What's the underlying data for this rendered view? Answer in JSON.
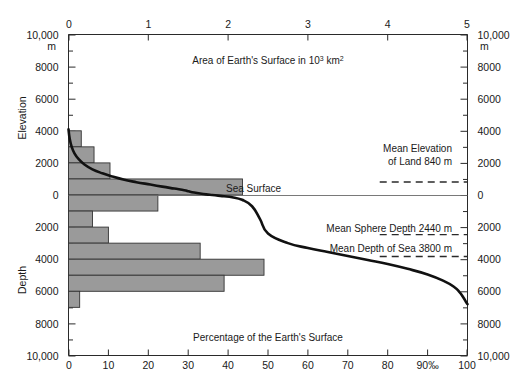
{
  "figure": {
    "top_caption": "Area of Earth's Surface in 10",
    "top_caption_sup": "3",
    "top_caption_tail": " km",
    "top_caption_sup2": "2",
    "bottom_caption": "Percentage of the Earth's Surface",
    "sea_surface_label": "Sea Surface",
    "left_axis_title_upper": "Elevation",
    "left_axis_title_lower": "Depth",
    "top_unit_left": "m",
    "top_unit_right": "m"
  },
  "annotations": [
    {
      "id": "mean-elevation-land",
      "line1": "Mean Elevation",
      "line2": "of Land 840 m",
      "value_m": 840
    },
    {
      "id": "mean-sphere-depth",
      "line1": "Mean Sphere Depth 2440 m",
      "line2": "",
      "value_m": -2440
    },
    {
      "id": "mean-depth-sea",
      "line1": "Mean Depth of Sea 3800 m",
      "line2": "",
      "value_m": -3800
    }
  ],
  "axes": {
    "left_ticks": [
      "10,000",
      "8000",
      "6000",
      "4000",
      "2000",
      "0",
      "2000",
      "4000",
      "6000",
      "8000",
      "10,000"
    ],
    "right_ticks": [
      "10,000",
      "8000",
      "6000",
      "4000",
      "2000",
      "0",
      "2000",
      "4000",
      "6000",
      "8000",
      "10,000"
    ],
    "top_ticks": [
      "0",
      "1",
      "2",
      "3",
      "4",
      "5"
    ],
    "bottom_ticks": [
      "0",
      "10",
      "20",
      "30",
      "40",
      "50",
      "60",
      "70",
      "80",
      "90%",
      "100"
    ],
    "bottom_permille_mark": "90‰",
    "y_range_m": [
      10000,
      -10000
    ],
    "top_x_range": [
      0,
      5
    ],
    "bottom_x_range": [
      0,
      100
    ]
  },
  "chart_data": {
    "type": "area",
    "xlabel": "Percentage of the Earth's Surface",
    "ylabel": "Elevation / Depth (m)",
    "xlim": [
      0,
      100
    ],
    "ylim": [
      -10000,
      10000
    ],
    "grid": false,
    "legend": "none",
    "series": [
      {
        "name": "Hypsographic curve",
        "type": "line",
        "color": "#111111",
        "x": [
          0.0,
          0.3,
          0.8,
          1.5,
          2.5,
          4.0,
          6.0,
          8.5,
          11.0,
          14.0,
          17.0,
          20.5,
          23.5,
          26.5,
          29.0,
          29.8,
          30.5,
          31.5,
          33.0,
          34.5,
          36.0,
          37.5,
          39.0,
          41.0,
          43.5,
          46.0,
          48.0,
          50.0,
          55.0,
          60.0,
          65.0,
          70.0,
          75.0,
          80.0,
          85.0,
          90.0,
          94.0,
          96.5,
          98.0,
          99.0,
          99.6,
          100.0
        ],
        "y": [
          4100,
          3500,
          3000,
          2600,
          2250,
          1900,
          1600,
          1350,
          1150,
          950,
          800,
          650,
          520,
          400,
          300,
          250,
          200,
          150,
          90,
          40,
          0,
          -40,
          -80,
          -140,
          -300,
          -700,
          -1500,
          -2400,
          -3000,
          -3300,
          -3550,
          -3800,
          -4050,
          -4300,
          -4600,
          -4950,
          -5350,
          -5700,
          -6050,
          -6400,
          -6650,
          -6800
        ]
      },
      {
        "name": "Area-frequency histogram (bars)",
        "type": "bar",
        "orientation": "horizontal",
        "color": "#9a9a9a",
        "edge_color": "#333333",
        "note": "Bar length read on top axis: Area of Earth's Surface in 10^3 km^2 (0-5)",
        "bins": [
          {
            "elev_top_m": 4000,
            "elev_bottom_m": 3000,
            "area_10e3km2": 0.16
          },
          {
            "elev_top_m": 3000,
            "elev_bottom_m": 2000,
            "area_10e3km2": 0.32
          },
          {
            "elev_top_m": 2000,
            "elev_bottom_m": 1000,
            "area_10e3km2": 0.52
          },
          {
            "elev_top_m": 1000,
            "elev_bottom_m": 0,
            "area_10e3km2": 2.18
          },
          {
            "elev_top_m": 0,
            "elev_bottom_m": -1000,
            "area_10e3km2": 1.12
          },
          {
            "elev_top_m": -1000,
            "elev_bottom_m": -2000,
            "area_10e3km2": 0.3
          },
          {
            "elev_top_m": -2000,
            "elev_bottom_m": -3000,
            "area_10e3km2": 0.5
          },
          {
            "elev_top_m": -3000,
            "elev_bottom_m": -4000,
            "area_10e3km2": 1.65
          },
          {
            "elev_top_m": -4000,
            "elev_bottom_m": -5000,
            "area_10e3km2": 2.45
          },
          {
            "elev_top_m": -5000,
            "elev_bottom_m": -6000,
            "area_10e3km2": 1.95
          },
          {
            "elev_top_m": -6000,
            "elev_bottom_m": -7000,
            "area_10e3km2": 0.14
          }
        ]
      }
    ],
    "reference_lines": [
      {
        "label": "Mean Elevation of Land 840 m",
        "y_m": 840,
        "style": "dashed",
        "x_from": 78,
        "x_to": 100
      },
      {
        "label": "Mean Sphere Depth 2440 m",
        "y_m": -2440,
        "style": "dashed",
        "x_from": 78,
        "x_to": 100
      },
      {
        "label": "Mean Depth of Sea 3800 m",
        "y_m": -3800,
        "style": "dashed",
        "x_from": 78,
        "x_to": 100
      }
    ],
    "sea_level_line": {
      "label": "Sea Surface",
      "y_m": 0,
      "style": "solid-thin"
    }
  }
}
